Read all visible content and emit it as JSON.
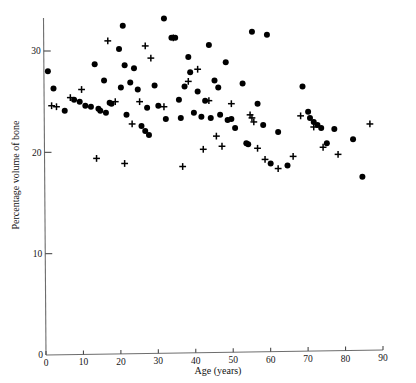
{
  "chart_data": {
    "type": "scatter",
    "title": "",
    "xlabel": "Age (years)",
    "ylabel": "Percentage volume of bone",
    "xlim": [
      0,
      90
    ],
    "ylim": [
      0,
      33.5
    ],
    "xticks": [
      0,
      10,
      20,
      30,
      40,
      50,
      60,
      70,
      80,
      90
    ],
    "xticklabels": [
      "0",
      "10",
      "20",
      "30",
      "40",
      "50",
      "60",
      "70",
      "80",
      "90"
    ],
    "yticks": [
      0,
      10,
      20,
      30
    ],
    "yticklabels": [
      "0",
      "10",
      "20",
      "30"
    ],
    "grid": false,
    "legend": false,
    "marker_colors": {
      "dot": "#000000",
      "cross": "#000000"
    },
    "axis_color": "#6d6d6d",
    "series": [
      {
        "name": "filled-circle",
        "marker": "circle",
        "points": [
          [
            0.5,
            28.0
          ],
          [
            2.0,
            26.3
          ],
          [
            5.0,
            24.1
          ],
          [
            7.5,
            25.2
          ],
          [
            9.0,
            25.0
          ],
          [
            10.5,
            24.6
          ],
          [
            12.0,
            24.5
          ],
          [
            13.0,
            28.7
          ],
          [
            14.0,
            24.3
          ],
          [
            14.5,
            24.1
          ],
          [
            15.5,
            27.1
          ],
          [
            16.0,
            23.9
          ],
          [
            17.0,
            24.9
          ],
          [
            17.5,
            24.8
          ],
          [
            19.5,
            30.2
          ],
          [
            20.0,
            26.4
          ],
          [
            20.5,
            32.5
          ],
          [
            21.0,
            28.6
          ],
          [
            21.5,
            23.7
          ],
          [
            22.5,
            26.9
          ],
          [
            23.5,
            28.3
          ],
          [
            24.5,
            26.2
          ],
          [
            25.5,
            22.6
          ],
          [
            26.5,
            22.1
          ],
          [
            27.0,
            24.4
          ],
          [
            27.5,
            21.7
          ],
          [
            29.0,
            26.6
          ],
          [
            30.0,
            24.6
          ],
          [
            31.5,
            33.2
          ],
          [
            32.0,
            23.3
          ],
          [
            33.5,
            31.3
          ],
          [
            34.5,
            31.3
          ],
          [
            35.5,
            25.2
          ],
          [
            36.0,
            23.4
          ],
          [
            37.0,
            26.5
          ],
          [
            38.0,
            29.4
          ],
          [
            38.5,
            27.9
          ],
          [
            39.5,
            23.9
          ],
          [
            40.5,
            26.0
          ],
          [
            41.5,
            23.5
          ],
          [
            42.5,
            25.1
          ],
          [
            43.5,
            30.6
          ],
          [
            44.0,
            23.4
          ],
          [
            45.0,
            27.1
          ],
          [
            46.0,
            26.4
          ],
          [
            46.5,
            23.7
          ],
          [
            48.0,
            28.9
          ],
          [
            48.5,
            23.2
          ],
          [
            49.5,
            23.3
          ],
          [
            50.5,
            22.4
          ],
          [
            52.5,
            26.8
          ],
          [
            53.5,
            20.9
          ],
          [
            54.0,
            20.8
          ],
          [
            55.0,
            31.9
          ],
          [
            56.5,
            24.8
          ],
          [
            58.0,
            22.7
          ],
          [
            59.0,
            31.6
          ],
          [
            60.0,
            18.9
          ],
          [
            62.0,
            22.0
          ],
          [
            64.5,
            18.7
          ],
          [
            68.5,
            26.5
          ],
          [
            70.0,
            24.0
          ],
          [
            70.5,
            23.4
          ],
          [
            71.5,
            23.0
          ],
          [
            72.5,
            22.7
          ],
          [
            73.5,
            22.4
          ],
          [
            75.0,
            20.9
          ],
          [
            77.0,
            22.3
          ],
          [
            82.0,
            21.3
          ],
          [
            84.5,
            17.6
          ]
        ]
      },
      {
        "name": "plus-cross",
        "marker": "plus",
        "points": [
          [
            1.5,
            24.6
          ],
          [
            2.8,
            24.5
          ],
          [
            6.5,
            25.4
          ],
          [
            9.5,
            26.2
          ],
          [
            13.5,
            19.4
          ],
          [
            16.5,
            31.0
          ],
          [
            18.5,
            25.0
          ],
          [
            21.0,
            18.9
          ],
          [
            23.0,
            22.8
          ],
          [
            25.0,
            25.0
          ],
          [
            26.5,
            30.5
          ],
          [
            28.0,
            29.3
          ],
          [
            31.5,
            24.5
          ],
          [
            34.0,
            31.3
          ],
          [
            36.5,
            18.6
          ],
          [
            38.0,
            27.0
          ],
          [
            40.5,
            28.2
          ],
          [
            42.0,
            20.3
          ],
          [
            43.5,
            25.1
          ],
          [
            45.5,
            21.6
          ],
          [
            47.0,
            20.6
          ],
          [
            49.5,
            24.8
          ],
          [
            54.5,
            23.7
          ],
          [
            55.0,
            23.4
          ],
          [
            55.5,
            23.0
          ],
          [
            56.5,
            20.4
          ],
          [
            58.5,
            19.3
          ],
          [
            62.0,
            18.4
          ],
          [
            66.0,
            19.6
          ],
          [
            68.0,
            23.6
          ],
          [
            71.5,
            22.5
          ],
          [
            74.0,
            20.5
          ],
          [
            78.0,
            19.8
          ],
          [
            86.5,
            22.8
          ]
        ]
      }
    ]
  },
  "axis": {
    "x_title": "Age (years)",
    "y_title": "Percentage volume of bone"
  }
}
